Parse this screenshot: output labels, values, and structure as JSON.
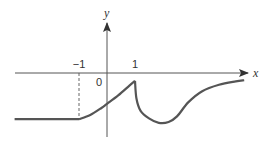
{
  "chart_data": {
    "type": "line",
    "title": "",
    "xlabel": "x",
    "ylabel": "y",
    "origin_label": "0",
    "x_ticks": [
      {
        "value": -1,
        "label": "−1"
      },
      {
        "value": 1,
        "label": "1"
      }
    ],
    "dashed_guides": [
      {
        "x": -1,
        "from_y": 0,
        "to_y": -1.65
      }
    ],
    "xlim": [
      -3.3,
      5.0
    ],
    "ylim": [
      -2.3,
      1.7
    ],
    "series": [
      {
        "name": "f(x)",
        "segments": [
          {
            "points": [
              [
                -3.3,
                -1.65
              ],
              [
                -1.0,
                -1.65
              ]
            ]
          },
          {
            "points": [
              [
                -1.0,
                -1.65
              ],
              [
                -0.6,
                -1.5
              ],
              [
                -0.2,
                -1.25
              ],
              [
                0.0,
                -1.1
              ],
              [
                0.4,
                -0.8
              ],
              [
                0.8,
                -0.45
              ],
              [
                1.0,
                -0.28
              ]
            ]
          },
          {
            "points": [
              [
                1.0,
                -0.28
              ],
              [
                1.05,
                -0.9
              ],
              [
                1.2,
                -1.35
              ],
              [
                1.5,
                -1.62
              ],
              [
                1.85,
                -1.78
              ],
              [
                2.2,
                -1.75
              ],
              [
                2.5,
                -1.55
              ],
              [
                2.9,
                -1.05
              ],
              [
                3.4,
                -0.65
              ],
              [
                4.0,
                -0.42
              ],
              [
                4.6,
                -0.3
              ],
              [
                4.9,
                -0.26
              ]
            ]
          }
        ]
      }
    ],
    "grid": false,
    "legend": "none"
  }
}
